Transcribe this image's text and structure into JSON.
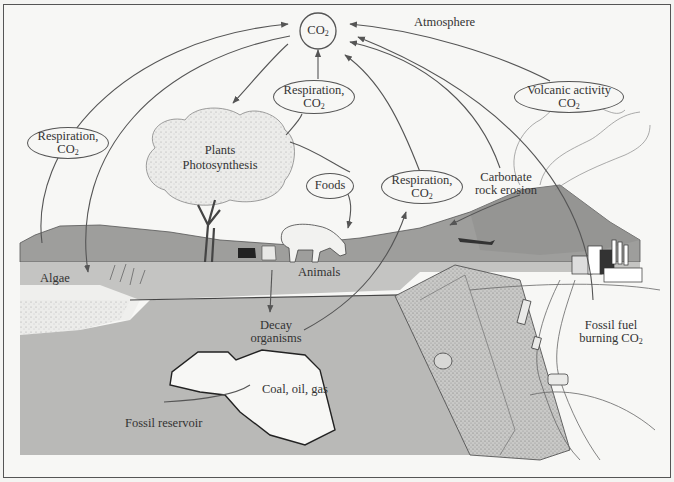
{
  "colors": {
    "background": "#f7f7f5",
    "ground": "#b9b9b7",
    "ground_dark": "#a8a8a6",
    "hills": "#9e9e9c",
    "line": "#555555",
    "text": "#333333"
  },
  "center": {
    "label": "CO",
    "sub": "2"
  },
  "labels": {
    "atmosphere": "Atmosphere",
    "respiration_left": {
      "line1": "Respiration,",
      "line2": "CO",
      "sub": "2"
    },
    "respiration_plants": {
      "line1": "Respiration,",
      "line2": "CO",
      "sub": "2"
    },
    "respiration_animals": {
      "line1": "Respiration,",
      "line2": "CO",
      "sub": "2"
    },
    "plants": {
      "line1": "Plants",
      "line2": "Photosynthesis"
    },
    "foods": "Foods",
    "carbonate": {
      "line1": "Carbonate",
      "line2": "rock erosion"
    },
    "volcanic": {
      "line1": "Volcanic activity",
      "line2": "CO",
      "sub": "2"
    },
    "algae": "Algae",
    "animals": "Animals",
    "decay": {
      "line1": "Decay",
      "line2": "organisms"
    },
    "coal": "Coal, oil, gas",
    "fossil_reservoir": "Fossil reservoir",
    "fossil_fuel": {
      "line1": "Fossil fuel",
      "line2": "burning CO",
      "sub": "2"
    }
  }
}
